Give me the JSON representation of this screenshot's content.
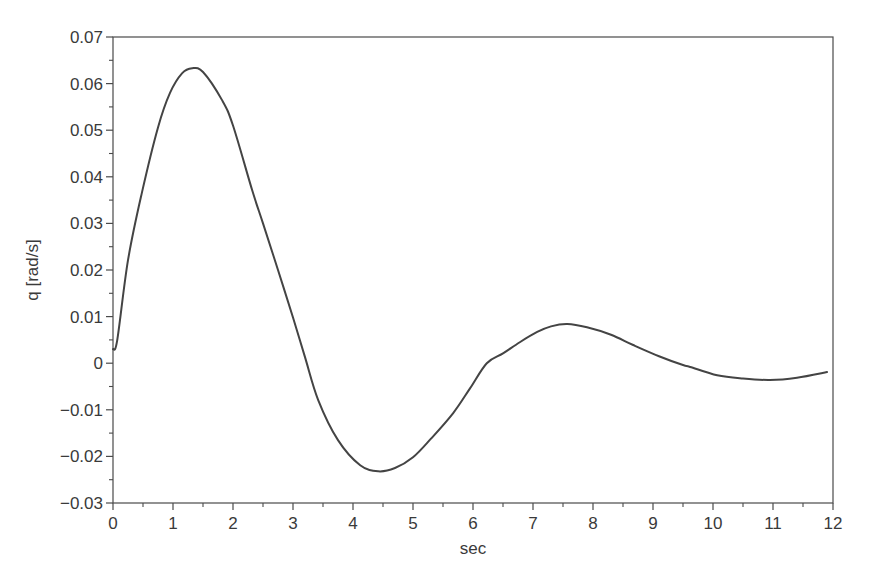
{
  "chart_data": {
    "type": "line",
    "title": "",
    "xlabel": "sec",
    "ylabel": "q [rad/s]",
    "xlim": [
      0,
      12
    ],
    "ylim": [
      -0.03,
      0.07
    ],
    "grid": false,
    "legend": null,
    "x_ticks": [
      0,
      1,
      2,
      3,
      4,
      5,
      6,
      7,
      8,
      9,
      10,
      11,
      12
    ],
    "x_tick_labels": [
      "0",
      "1",
      "2",
      "3",
      "4",
      "5",
      "6",
      "7",
      "8",
      "9",
      "10",
      "11",
      "12"
    ],
    "y_ticks": [
      -0.03,
      -0.02,
      -0.01,
      0,
      0.01,
      0.02,
      0.03,
      0.04,
      0.05,
      0.06,
      0.07
    ],
    "y_tick_labels": [
      "−0.03",
      "−0.02",
      "−0.01",
      "0",
      "0.01",
      "0.02",
      "0.03",
      "0.04",
      "0.05",
      "0.06",
      "0.07"
    ],
    "series": [
      {
        "name": "q",
        "color": "#444444",
        "x": [
          0,
          0.07,
          0.25,
          0.48,
          0.75,
          0.95,
          1.15,
          1.32,
          1.5,
          1.82,
          2.0,
          2.32,
          2.5,
          2.75,
          3.0,
          3.2,
          3.42,
          3.75,
          4.12,
          4.42,
          4.7,
          5.0,
          5.3,
          5.67,
          5.95,
          6.23,
          6.5,
          6.78,
          7.07,
          7.3,
          7.57,
          7.9,
          8.3,
          8.67,
          9.1,
          9.5,
          9.62,
          10.07,
          10.5,
          10.95,
          11.4,
          11.9
        ],
        "values": [
          0.003,
          0.0049,
          0.0221,
          0.0365,
          0.0506,
          0.058,
          0.0622,
          0.0633,
          0.0625,
          0.0564,
          0.051,
          0.0371,
          0.03,
          0.02,
          0.0098,
          0.0013,
          -0.0079,
          -0.0165,
          -0.0219,
          -0.0232,
          -0.0225,
          -0.0202,
          -0.0162,
          -0.0107,
          -0.0054,
          0.0,
          0.0021,
          0.0045,
          0.0067,
          0.0079,
          0.0084,
          0.0077,
          0.0061,
          0.0039,
          0.0015,
          -0.0004,
          -0.0008,
          -0.0026,
          -0.0033,
          -0.0036,
          -0.0031,
          -0.0019
        ]
      }
    ]
  },
  "colors": {
    "axis": "#4a4a4a",
    "curve": "#444444",
    "background": "#ffffff"
  }
}
